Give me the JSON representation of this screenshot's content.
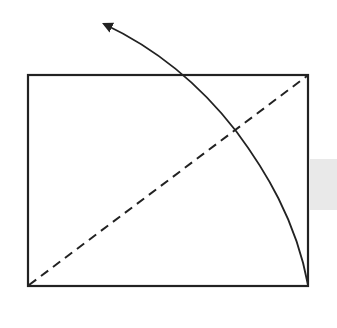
{
  "diagram": {
    "type": "geometric-fold-illustration",
    "colors": {
      "stroke": "#222222",
      "background": "#ffffff",
      "side_tab": "#e9e9e9"
    },
    "rectangle": {
      "x": 28,
      "y": 75,
      "width": 280,
      "height": 211
    },
    "diagonal": {
      "style": "dashed",
      "from": [
        28,
        286
      ],
      "to": [
        308,
        75
      ]
    },
    "arc_arrow": {
      "from": [
        308,
        286
      ],
      "to": [
        100,
        22
      ],
      "passes_through": [
        [
          283,
          220
        ],
        [
          253,
          160
        ],
        [
          236,
          130
        ],
        [
          182,
          75
        ]
      ],
      "arrowhead": "at-end"
    },
    "side_tab": {
      "x": 310,
      "y": 159,
      "width": 27,
      "height": 51
    }
  }
}
